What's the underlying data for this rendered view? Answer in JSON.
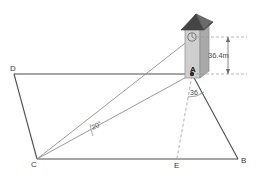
{
  "diagram": {
    "colors": {
      "ground_line": "#4d4d4d",
      "sight_line": "#8a8a8a",
      "dashed_line": "#9a9a9a",
      "tower_front": "#c9c9c9",
      "tower_side": "#a8a8a8",
      "roof_dark": "#4a4a4a",
      "roof_light": "#6f6f6f",
      "text": "#3a3a3a"
    },
    "vertices": [
      {
        "id": "vertex-d",
        "label": "D",
        "x": 14,
        "y": 74
      },
      {
        "id": "vertex-c",
        "label": "C",
        "x": 37,
        "y": 159
      },
      {
        "id": "vertex-b",
        "label": "B",
        "x": 238,
        "y": 159
      },
      {
        "id": "vertex-e",
        "label": "E",
        "x": 177,
        "y": 159
      },
      {
        "id": "vertex-a",
        "label": "A",
        "x": 192,
        "y": 74
      }
    ],
    "angles": [
      {
        "id": "angle-at-c",
        "label": "20°",
        "value": 20,
        "unit": "degrees",
        "at_vertex": "C"
      },
      {
        "id": "angle-at-a",
        "label": "36",
        "value": 36,
        "unit": "degrees",
        "at_vertex": "A"
      }
    ],
    "measurements": [
      {
        "id": "tower-height",
        "label": "36.4m",
        "value": 36.4,
        "unit": "m",
        "orientation": "vertical"
      }
    ],
    "markers": [
      {
        "id": "tower-top-marker",
        "label": "",
        "shape": "circle-with-tick"
      }
    ]
  }
}
